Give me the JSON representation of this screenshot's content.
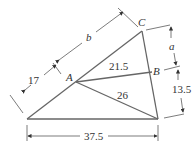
{
  "diagram": {
    "points": {
      "A": "A",
      "B": "B",
      "C": "C"
    },
    "segment_labels": {
      "AB": "21.5",
      "A_to_bottom_right": "26",
      "lower_left_side": "17",
      "upper_left_side": "b",
      "right_upper": "a",
      "right_lower": "13.5",
      "base": "37.5"
    }
  }
}
